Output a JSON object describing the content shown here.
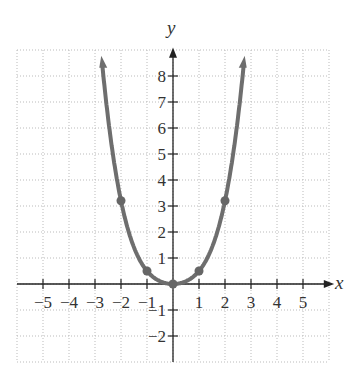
{
  "chart_data": {
    "type": "line",
    "title": "",
    "xlabel": "x",
    "ylabel": "y",
    "xlim": [
      -5.5,
      5.5
    ],
    "ylim": [
      -3,
      9
    ],
    "grid": true,
    "x_ticks": [
      -5,
      -4,
      -3,
      -2,
      -1,
      1,
      2,
      3,
      4,
      5
    ],
    "y_ticks": [
      -2,
      -1,
      1,
      2,
      3,
      4,
      5,
      6,
      7,
      8
    ],
    "series": [
      {
        "name": "curve",
        "points": [
          [
            -3.05,
            9
          ],
          [
            -2,
            3.2
          ],
          [
            -1,
            0.5
          ],
          [
            0,
            0
          ],
          [
            1,
            0.5
          ],
          [
            2,
            3.2
          ],
          [
            3.05,
            9
          ]
        ],
        "color": "#6e6e6e",
        "arrows_at_ends": true
      }
    ],
    "marked_points": [
      [
        -2,
        3.2
      ],
      [
        -1,
        0.5
      ],
      [
        0,
        0
      ],
      [
        1,
        0.5
      ],
      [
        2,
        3.2
      ]
    ]
  },
  "labels": {
    "x": "x",
    "y": "y"
  }
}
